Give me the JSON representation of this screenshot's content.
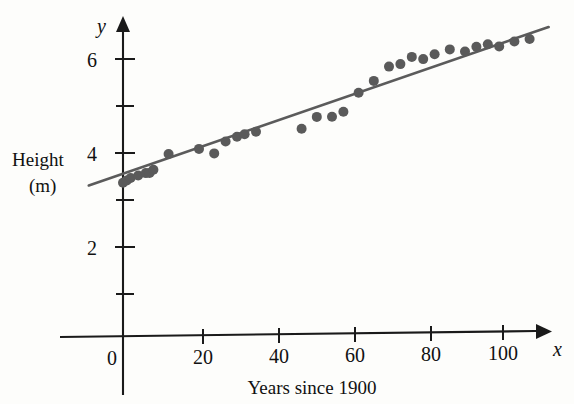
{
  "chart_data": {
    "type": "scatter",
    "title": "",
    "xlabel": "Years since 1900",
    "ylabel": "Height (m)",
    "x_axis_name": "x",
    "y_axis_name": "y",
    "xlim": [
      -12,
      118
    ],
    "ylim": [
      0,
      7.1
    ],
    "xticks": [
      0,
      20,
      40,
      60,
      80,
      100
    ],
    "xtick_labels": [
      "0",
      "20",
      "40",
      "60",
      "80",
      "100"
    ],
    "yticks": [
      2,
      4,
      6
    ],
    "ytick_labels": [
      "2",
      "4",
      "6"
    ],
    "y_minor_ticks": [
      1,
      3,
      5
    ],
    "grid": false,
    "legend": "none",
    "point_color": "#5a5a5a",
    "line_color": "#5b5b5b",
    "axis_color": "#1a1a1a",
    "x": [
      0,
      1,
      2,
      4,
      6,
      7,
      8,
      12,
      20,
      24,
      27,
      30,
      32,
      35,
      47,
      51,
      55,
      58,
      62,
      66,
      70,
      73,
      76,
      79,
      82,
      86,
      90,
      93,
      96,
      99,
      103,
      107
    ],
    "y": [
      3.35,
      3.4,
      3.45,
      3.5,
      3.55,
      3.55,
      3.62,
      3.95,
      4.05,
      3.95,
      4.2,
      4.3,
      4.35,
      4.4,
      4.45,
      4.7,
      4.7,
      4.8,
      5.2,
      5.45,
      5.75,
      5.8,
      5.95,
      5.9,
      6.0,
      6.1,
      6.05,
      6.15,
      6.2,
      6.15,
      6.25,
      6.3
    ],
    "trend_line": {
      "x_start": -9,
      "y_start": 3.3,
      "x_end": 112,
      "y_end": 6.55
    }
  },
  "labels": {
    "y_axis_letter": "y",
    "x_axis_letter": "x",
    "height_line1": "Height",
    "height_line2": "(m)",
    "x_caption": "Years since 1900",
    "tick_0": "0",
    "tick_20": "20",
    "tick_40": "40",
    "tick_60": "60",
    "tick_80": "80",
    "tick_100": "100",
    "tick_y2": "2",
    "tick_y4": "4",
    "tick_y6": "6"
  }
}
